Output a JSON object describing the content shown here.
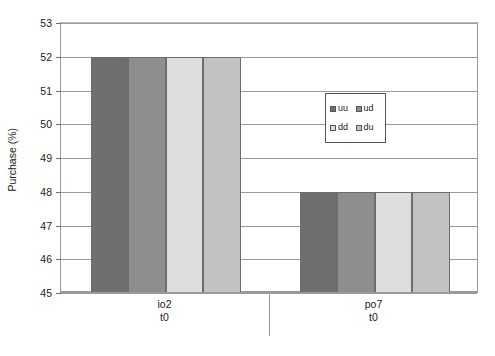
{
  "chart_data": {
    "type": "bar",
    "title": "",
    "subtitle": "",
    "xlabel": "",
    "ylabel": "Purchase (%)",
    "ylim": [
      45,
      53
    ],
    "yticks": [
      45,
      46,
      47,
      48,
      49,
      50,
      51,
      52,
      53
    ],
    "ytick_labels": [
      "45",
      "46",
      "47",
      "48",
      "49",
      "50",
      "51",
      "52",
      "53"
    ],
    "grid": "horizontal",
    "legend_position": "upper-right-inside",
    "categories": [
      "io2",
      "po7"
    ],
    "category_sublabels": [
      "t0",
      "t0"
    ],
    "series": [
      {
        "name": "uu",
        "values": [
          52,
          48
        ],
        "color": "#6f6f6f"
      },
      {
        "name": "ud",
        "values": [
          52,
          48
        ],
        "color": "#8e8e8e"
      },
      {
        "name": "dd",
        "values": [
          52,
          48
        ],
        "color": "#dedede"
      },
      {
        "name": "du",
        "values": [
          52,
          48
        ],
        "color": "#c2c2c2"
      }
    ],
    "legend_entries": [
      {
        "label": "uu",
        "color": "#6f6f6f"
      },
      {
        "label": "ud",
        "color": "#8e8e8e"
      },
      {
        "label": "dd",
        "color": "#dedede"
      },
      {
        "label": "du",
        "color": "#c2c2c2"
      }
    ],
    "axis_color": "#9a9a9a",
    "background": "#ffffff"
  }
}
